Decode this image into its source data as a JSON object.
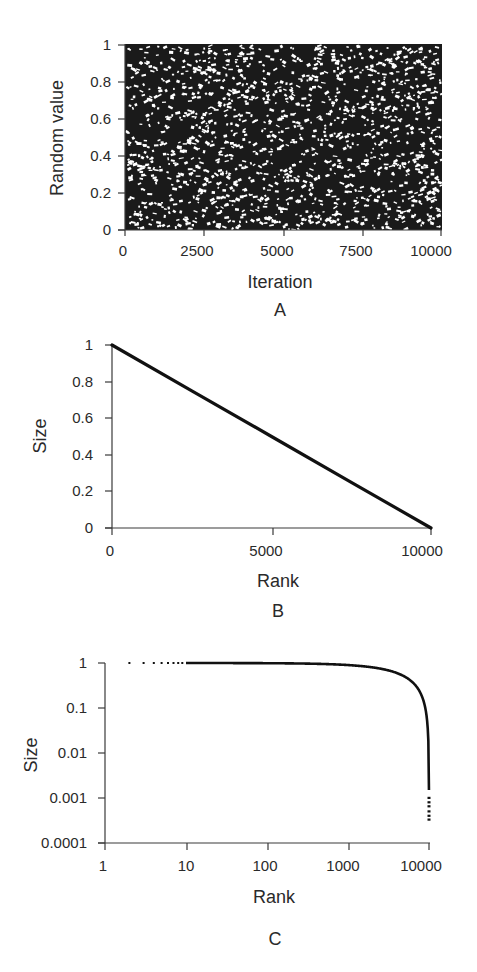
{
  "chart_data": [
    {
      "panel": "A",
      "type": "scatter",
      "title": "",
      "xlabel": "Iteration",
      "ylabel": "Random value",
      "xlim": [
        0,
        10000
      ],
      "ylim": [
        0,
        1
      ],
      "xticks": [
        "0",
        "2500",
        "5000",
        "7500",
        "10000"
      ],
      "yticks": [
        "0",
        "0.2",
        "0.4",
        "0.6",
        "0.8",
        "1"
      ],
      "n_points": 10000,
      "description": "10000 uniformly distributed random values in [0,1] plotted against iteration",
      "grid": false,
      "color": "#111111"
    },
    {
      "panel": "B",
      "type": "line",
      "title": "",
      "xlabel": "Rank",
      "ylabel": "Size",
      "xlim": [
        0,
        10000
      ],
      "ylim": [
        0,
        1
      ],
      "xticks": [
        "0",
        "5000",
        "10000"
      ],
      "yticks": [
        "0",
        "0.2",
        "0.4",
        "0.6",
        "0.8",
        "1"
      ],
      "x": [
        0,
        2500,
        5000,
        7500,
        10000
      ],
      "values": [
        1.0,
        0.75,
        0.5,
        0.25,
        0.0
      ],
      "grid": false,
      "color": "#111111"
    },
    {
      "panel": "C",
      "type": "line",
      "title": "",
      "xlabel": "Rank",
      "ylabel": "Size",
      "xscale": "log",
      "yscale": "log",
      "xlim": [
        1,
        10000
      ],
      "ylim": [
        0.0001,
        1
      ],
      "xticks": [
        "1",
        "10",
        "100",
        "1000",
        "10000"
      ],
      "yticks": [
        "0.0001",
        "0.001",
        "0.01",
        "0.1",
        "1"
      ],
      "x": [
        2,
        3,
        5,
        8,
        10,
        100,
        1000,
        3000,
        5000,
        7000,
        9000,
        9500,
        9900,
        9985,
        9997
      ],
      "values": [
        0.9998,
        0.9997,
        0.9995,
        0.9992,
        0.999,
        0.99,
        0.9,
        0.7,
        0.5,
        0.3,
        0.1,
        0.05,
        0.01,
        0.0015,
        0.0003
      ],
      "grid": false,
      "color": "#111111"
    }
  ],
  "panels": {
    "a": {
      "label": "A",
      "xlabel": "Iteration",
      "ylabel": "Random value",
      "xticks": [
        "0",
        "2500",
        "5000",
        "7500",
        "10000"
      ],
      "yticks": [
        "0",
        "0.2",
        "0.4",
        "0.6",
        "0.8",
        "1"
      ]
    },
    "b": {
      "label": "B",
      "xlabel": "Rank",
      "ylabel": "Size",
      "xticks": [
        "0",
        "5000",
        "10000"
      ],
      "yticks": [
        "0",
        "0.2",
        "0.4",
        "0.6",
        "0.8",
        "1"
      ]
    },
    "c": {
      "label": "C",
      "xlabel": "Rank",
      "ylabel": "Size",
      "xticks": [
        "1",
        "10",
        "100",
        "1000",
        "10000"
      ],
      "yticks": [
        "0.0001",
        "0.001",
        "0.01",
        "0.1",
        "1"
      ]
    }
  }
}
